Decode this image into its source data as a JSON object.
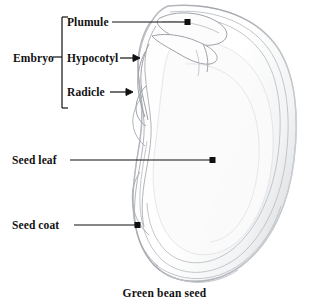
{
  "figure": {
    "caption": "Green bean seed",
    "style": "pencil-sketch-line-drawing",
    "background_color": "#ffffff",
    "ink_color": "#111111",
    "sketch_color": "#b9bcc2"
  },
  "group_labels": {
    "embryo": "Embryo"
  },
  "part_labels": {
    "plumule": "Plumule",
    "hypocotyl": "Hypocotyl",
    "radicle": "Radicle",
    "seed_leaf": "Seed leaf",
    "seed_coat": "Seed coat"
  },
  "annotations": [
    {
      "id": "plumule",
      "label": "Plumule",
      "connector": "leader-line-with-square-dot",
      "target": "plumule-tip"
    },
    {
      "id": "hypocotyl",
      "label": "Hypocotyl",
      "connector": "short-arrow",
      "target": "hypocotyl-region"
    },
    {
      "id": "radicle",
      "label": "Radicle",
      "connector": "short-arrow",
      "target": "radicle-region"
    },
    {
      "id": "seed-leaf",
      "label": "Seed leaf",
      "connector": "long-leader-line-with-square-dot",
      "target": "cotyledon-body"
    },
    {
      "id": "seed-coat",
      "label": "Seed coat",
      "connector": "leader-line-with-square-dot",
      "target": "seed-coat-edge"
    }
  ],
  "bracket": {
    "name": "embryo-bracket",
    "groups": [
      "Plumule",
      "Hypocotyl",
      "Radicle"
    ]
  }
}
